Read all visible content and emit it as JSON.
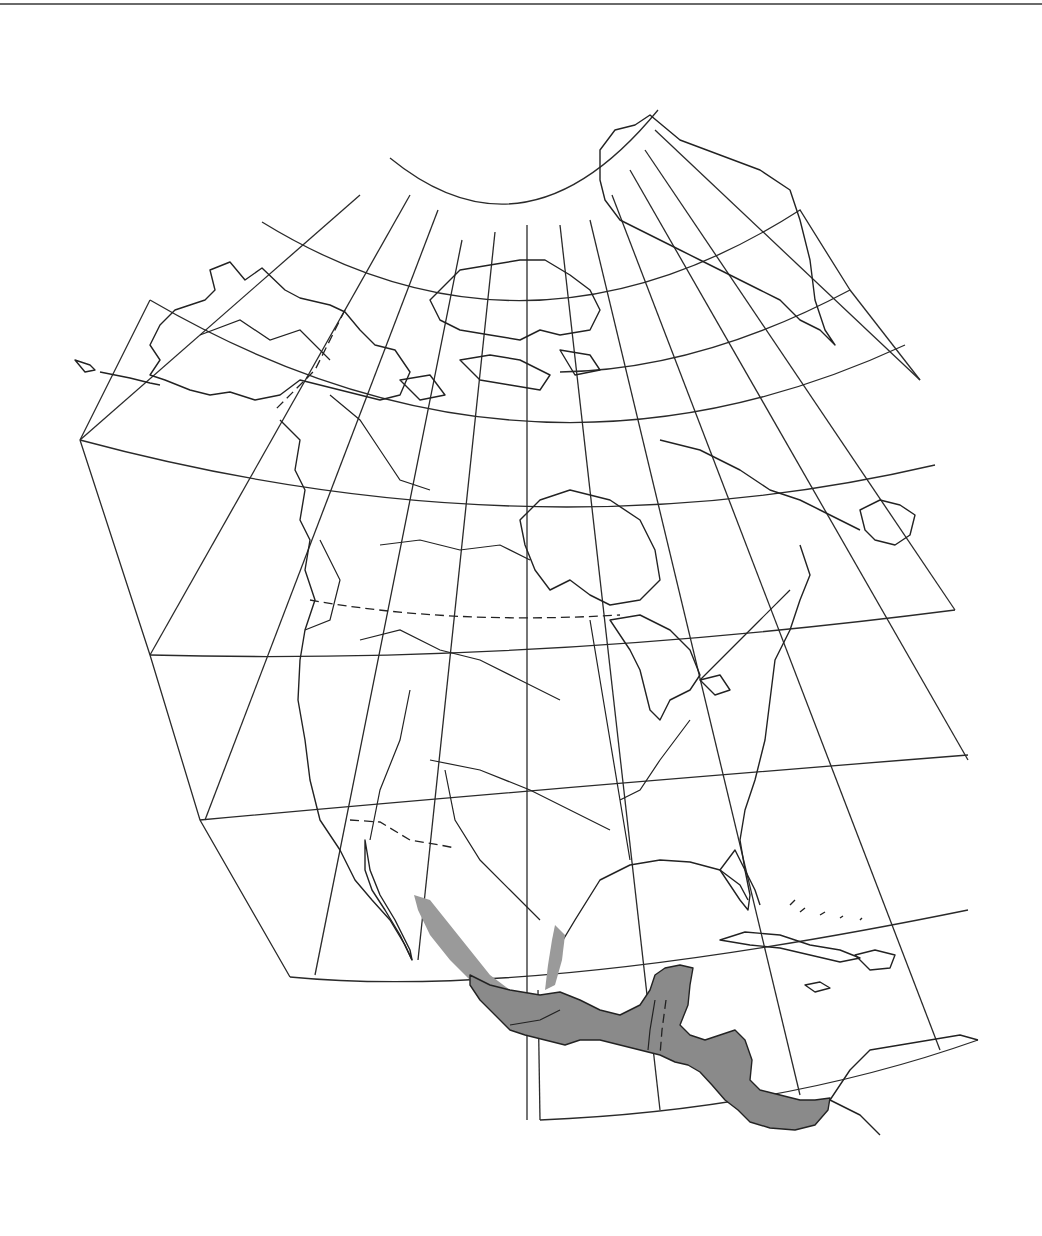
{
  "map": {
    "subject": "North America outline map",
    "projection": "conic graticule",
    "colors": {
      "background": "#ffffff",
      "lines": "#222222",
      "shaded_region": "#8a8a8a",
      "top_rule": "#6a6a6a"
    },
    "legend": [],
    "labels": [],
    "shaded_region": {
      "name": "Mexico and Central America highlighted range",
      "fill": "#8a8a8a"
    },
    "layers": [
      "top-rule",
      "graticule",
      "coastlines",
      "rivers",
      "political-borders-dashed",
      "shaded-range"
    ]
  }
}
